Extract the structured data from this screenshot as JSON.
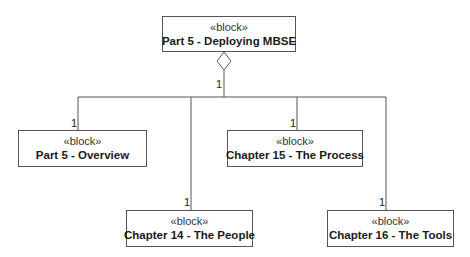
{
  "diagram": {
    "type": "SysML block definition (composition/aggregation tree)",
    "line_color": "#555555",
    "root": {
      "stereotype": "«block»",
      "name": "Part 5 - Deploying MBSE",
      "multiplicity": "1",
      "end_symbol": "hollow-diamond"
    },
    "children": [
      {
        "stereotype": "«block»",
        "name": "Part 5 - Overview",
        "multiplicity": "1"
      },
      {
        "stereotype": "«block»",
        "name": "Chapter 14 - The People",
        "multiplicity": "1"
      },
      {
        "stereotype": "«block»",
        "name": "Chapter 15 - The Process",
        "multiplicity": "1"
      },
      {
        "stereotype": "«block»",
        "name": "Chapter 16 - The Tools",
        "multiplicity": "1"
      }
    ]
  }
}
